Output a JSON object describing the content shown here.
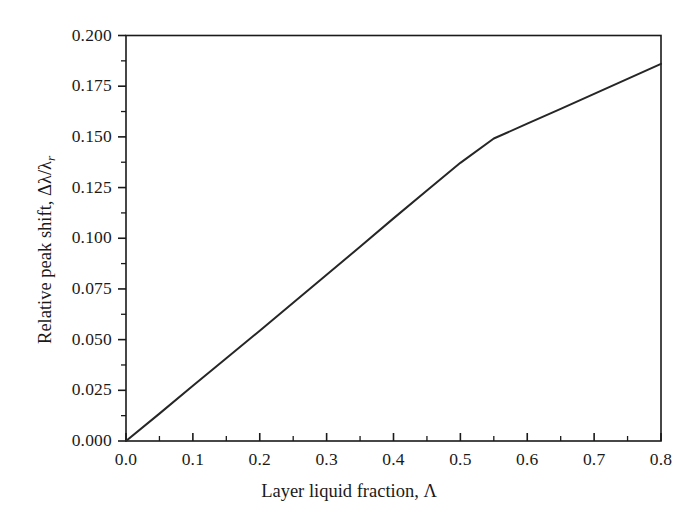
{
  "figure": {
    "background_color": "#ffffff",
    "line_color": "#262626",
    "axis_color": "#1a1a1a"
  },
  "axes": {
    "x_label_prefix": "Layer liquid fraction, ",
    "x_label_symbol": "Λ",
    "y_label_prefix": "Relative peak shift, ",
    "y_label_symbol": "Δλ/λ",
    "y_label_subscript": "r"
  },
  "chart_data": {
    "type": "line",
    "title": "",
    "xlabel": "Layer liquid fraction, Λ",
    "ylabel": "Relative peak shift, Δλ/λ_r",
    "xlim": [
      0.0,
      0.8
    ],
    "ylim": [
      0.0,
      0.2
    ],
    "grid": false,
    "legend": "none",
    "x_ticks": [
      0.0,
      0.1,
      0.2,
      0.3,
      0.4,
      0.5,
      0.6,
      0.7,
      0.8
    ],
    "x_tick_labels": [
      "0.0",
      "0.1",
      "0.2",
      "0.3",
      "0.4",
      "0.5",
      "0.6",
      "0.7",
      "0.8"
    ],
    "x_minor_tick_interval": 0.05,
    "y_ticks": [
      0.0,
      0.025,
      0.05,
      0.075,
      0.1,
      0.125,
      0.15,
      0.175,
      0.2
    ],
    "y_tick_labels": [
      "0.000",
      "0.025",
      "0.050",
      "0.075",
      "0.100",
      "0.125",
      "0.150",
      "0.175",
      "0.200"
    ],
    "y_minor_tick_interval": 0.0125,
    "series": [
      {
        "name": "relative peak shift",
        "color": "#262626",
        "line_width": 2,
        "x": [
          0.0,
          0.05,
          0.1,
          0.15,
          0.2,
          0.25,
          0.3,
          0.35,
          0.4,
          0.45,
          0.5,
          0.55,
          0.6,
          0.65,
          0.7,
          0.75,
          0.8
        ],
        "y": [
          0.0,
          0.0135,
          0.0272,
          0.0408,
          0.0544,
          0.0682,
          0.082,
          0.0958,
          0.1098,
          0.1236,
          0.1372,
          0.1492,
          0.1565,
          0.1638,
          0.1712,
          0.1786,
          0.186
        ]
      }
    ]
  }
}
